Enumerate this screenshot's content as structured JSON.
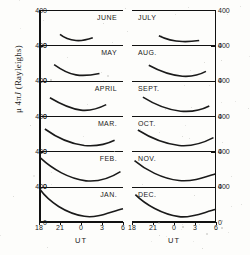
{
  "figure": {
    "kind": "multi-panel-line-plot",
    "axis_label_y": "μ 4π𝒥 (Rayleighs)",
    "axis_label_x": "UT",
    "columns": 2,
    "rows": 6
  },
  "yaxis": {
    "ticks": [
      "400",
      "0"
    ],
    "min": 0,
    "max": 400,
    "units": "Rayleighs",
    "label_parts": {
      "mu": "μ",
      "four_pi": "4π",
      "script_j": "J",
      "units_paren": "(Rayleighs)"
    }
  },
  "xaxis": {
    "label": "UT",
    "ticks": [
      "18",
      "21",
      "0",
      "3",
      "6"
    ],
    "tick_positions": [
      0,
      25,
      50,
      75,
      100
    ]
  },
  "panels_left": [
    {
      "month": "JUNE"
    },
    {
      "month": "MAY"
    },
    {
      "month": "APRIL"
    },
    {
      "month": "MAR."
    },
    {
      "month": "FEB."
    },
    {
      "month": "JAN."
    }
  ],
  "panels_right": [
    {
      "month": "JULY"
    },
    {
      "month": "AUG."
    },
    {
      "month": "SEPT."
    },
    {
      "month": "OCT."
    },
    {
      "month": "NOV."
    },
    {
      "month": "DEC."
    }
  ],
  "chart_data": {
    "type": "line",
    "title": "",
    "xlabel": "UT",
    "ylabel": "μ 4πJ (Rayleighs)",
    "xlim": [
      18,
      30
    ],
    "ylim": [
      0,
      400
    ],
    "x_tick_labels": [
      "18",
      "21",
      "0",
      "3",
      "6"
    ],
    "x_tick_values": [
      18,
      21,
      24,
      27,
      30
    ],
    "y_tick_values": [
      0,
      400
    ],
    "grid": false,
    "legend": "none",
    "note": "Each panel is one month; x is Universal Time from 18h through 06h, y is mu*4*pi*J airglow intensity in Rayleighs, 0 to 400 full scale.",
    "series": [
      {
        "name": "JUNE",
        "column": "left",
        "row": 1,
        "x": [
          21.0,
          21.8,
          22.6,
          23.4,
          24.2,
          25.0,
          25.6
        ],
        "y": [
          130,
          100,
          80,
          70,
          72,
          85,
          95
        ]
      },
      {
        "name": "MAY",
        "column": "left",
        "row": 2,
        "x": [
          20.2,
          21.0,
          21.8,
          22.6,
          23.4,
          24.2,
          25.2,
          26.2
        ],
        "y": [
          185,
          140,
          105,
          80,
          68,
          68,
          78,
          85
        ]
      },
      {
        "name": "APRIL",
        "column": "left",
        "row": 3,
        "x": [
          19.6,
          20.6,
          21.6,
          22.6,
          23.6,
          24.6,
          25.6,
          26.6,
          27.4
        ],
        "y": [
          215,
          170,
          125,
          90,
          72,
          68,
          80,
          105,
          135
        ]
      },
      {
        "name": "MAR.",
        "column": "left",
        "row": 4,
        "x": [
          18.6,
          19.6,
          20.6,
          21.8,
          23.0,
          24.2,
          25.4,
          26.6,
          27.8,
          28.8
        ],
        "y": [
          260,
          205,
          155,
          110,
          82,
          68,
          66,
          72,
          95,
          130
        ]
      },
      {
        "name": "FEB.",
        "column": "left",
        "row": 5,
        "x": [
          18.1,
          19.2,
          20.4,
          21.6,
          22.8,
          24.0,
          25.2,
          26.4,
          27.6,
          28.8,
          29.8
        ],
        "y": [
          330,
          250,
          180,
          125,
          88,
          68,
          62,
          70,
          95,
          140,
          175
        ]
      },
      {
        "name": "JAN.",
        "column": "left",
        "row": 6,
        "x": [
          18.0,
          19.0,
          20.0,
          21.2,
          22.4,
          23.6,
          24.8,
          26.0,
          27.0,
          28.0,
          29.0,
          30.0
        ],
        "y": [
          390,
          290,
          205,
          140,
          95,
          70,
          60,
          62,
          78,
          115,
          140,
          150
        ]
      },
      {
        "name": "JULY",
        "column": "right",
        "row": 1,
        "x": [
          21.8,
          22.6,
          23.4,
          24.2,
          25.0,
          25.8,
          26.4
        ],
        "y": [
          110,
          82,
          65,
          58,
          58,
          62,
          66
        ]
      },
      {
        "name": "AUG.",
        "column": "right",
        "row": 2,
        "x": [
          20.4,
          21.4,
          22.4,
          23.4,
          24.4,
          25.4,
          26.4,
          27.4
        ],
        "y": [
          175,
          130,
          95,
          72,
          60,
          58,
          68,
          88
        ]
      },
      {
        "name": "SEPT.",
        "column": "right",
        "row": 3,
        "x": [
          19.6,
          20.6,
          21.8,
          23.0,
          24.2,
          25.4,
          26.6,
          27.8,
          28.6
        ],
        "y": [
          225,
          175,
          125,
          88,
          68,
          62,
          70,
          95,
          120
        ]
      },
      {
        "name": "OCT.",
        "column": "right",
        "row": 4,
        "x": [
          18.6,
          19.8,
          21.0,
          22.2,
          23.4,
          24.6,
          25.8,
          27.0,
          28.2,
          29.2
        ],
        "y": [
          250,
          195,
          145,
          105,
          80,
          70,
          72,
          90,
          125,
          160
        ]
      },
      {
        "name": "NOV.",
        "column": "right",
        "row": 5,
        "x": [
          18.2,
          19.4,
          20.6,
          21.8,
          23.0,
          24.2,
          25.4,
          26.6,
          27.8,
          29.0,
          29.9
        ],
        "y": [
          300,
          235,
          175,
          125,
          92,
          72,
          66,
          72,
          100,
          135,
          150
        ]
      },
      {
        "name": "DEC.",
        "column": "right",
        "row": 6,
        "x": [
          18.3,
          19.4,
          20.6,
          21.8,
          23.0,
          24.2,
          25.4,
          26.6,
          27.8,
          29.0,
          30.0
        ],
        "y": [
          320,
          245,
          175,
          120,
          85,
          64,
          58,
          62,
          85,
          125,
          145
        ]
      }
    ]
  }
}
